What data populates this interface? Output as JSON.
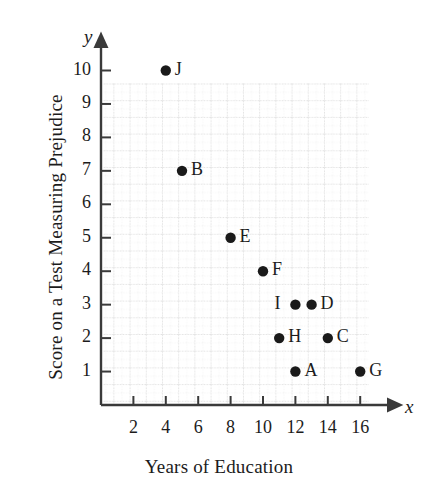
{
  "chart_data": {
    "type": "scatter",
    "title": "",
    "xlabel": "Years of Education",
    "ylabel": "Score on a Test Measuring Prejudice",
    "x_axis_variable": "x",
    "y_axis_variable": "y",
    "xlim": [
      0,
      17.5
    ],
    "ylim": [
      0,
      10.8
    ],
    "xticks": [
      2,
      4,
      6,
      8,
      10,
      12,
      14,
      16
    ],
    "yticks": [
      1,
      2,
      3,
      4,
      5,
      6,
      7,
      8,
      9,
      10
    ],
    "grid": true,
    "grid_style": "dotted light gray minor and major lines",
    "legend": "none",
    "point_color": "#1a1a1a",
    "axis_color": "#3a3a3a",
    "grid_color": "#d8d8d8",
    "points": [
      {
        "label": "J",
        "x": 4,
        "y": 10,
        "label_side": "right"
      },
      {
        "label": "B",
        "x": 5,
        "y": 7,
        "label_side": "right"
      },
      {
        "label": "E",
        "x": 8,
        "y": 5,
        "label_side": "right"
      },
      {
        "label": "F",
        "x": 10,
        "y": 4,
        "label_side": "right"
      },
      {
        "label": "I",
        "x": 12,
        "y": 3,
        "label_side": "left"
      },
      {
        "label": "D",
        "x": 13,
        "y": 3,
        "label_side": "right"
      },
      {
        "label": "H",
        "x": 11,
        "y": 2,
        "label_side": "right"
      },
      {
        "label": "C",
        "x": 14,
        "y": 2,
        "label_side": "right"
      },
      {
        "label": "A",
        "x": 12,
        "y": 1,
        "label_side": "right"
      },
      {
        "label": "G",
        "x": 16,
        "y": 1,
        "label_side": "right"
      }
    ]
  }
}
